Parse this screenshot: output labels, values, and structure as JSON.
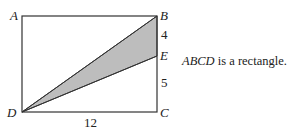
{
  "figure": {
    "points": {
      "A": {
        "label": "A",
        "x": 22,
        "y": 16
      },
      "B": {
        "label": "B",
        "x": 157,
        "y": 16
      },
      "C": {
        "label": "C",
        "x": 157,
        "y": 112
      },
      "D": {
        "label": "D",
        "x": 22,
        "y": 112
      },
      "E": {
        "label": "E",
        "x": 157,
        "y": 56
      }
    },
    "measurements": {
      "BE": "4",
      "EC": "5",
      "DC": "12"
    },
    "shaded_region": "triangle DBE",
    "shade_color": "#bdbdbd",
    "line_color": "#333333"
  },
  "caption": {
    "subject": "ABCD",
    "text": " is a rectangle."
  }
}
